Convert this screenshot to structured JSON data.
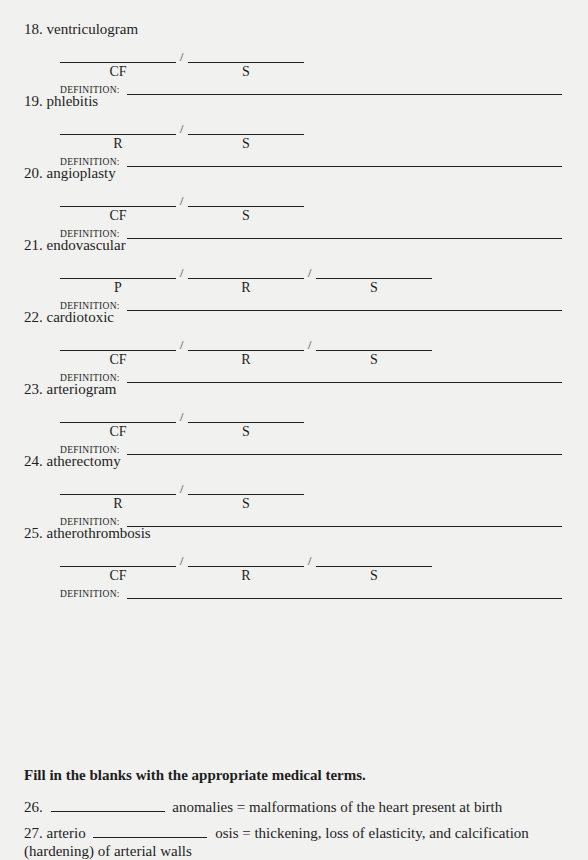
{
  "labels": {
    "definition": "DEFINITION:",
    "slash": "/"
  },
  "items": [
    {
      "number": "18.",
      "term": "ventriculogram",
      "parts": [
        "CF",
        "S"
      ]
    },
    {
      "number": "19.",
      "term": "phlebitis",
      "parts": [
        "R",
        "S"
      ]
    },
    {
      "number": "20.",
      "term": "angioplasty",
      "parts": [
        "CF",
        "S"
      ]
    },
    {
      "number": "21.",
      "term": "endovascular",
      "parts": [
        "P",
        "R",
        "S"
      ]
    },
    {
      "number": "22.",
      "term": "cardiotoxic",
      "parts": [
        "CF",
        "R",
        "S"
      ]
    },
    {
      "number": "23.",
      "term": "arteriogram",
      "parts": [
        "CF",
        "S"
      ]
    },
    {
      "number": "24.",
      "term": "atherectomy",
      "parts": [
        "R",
        "S"
      ]
    },
    {
      "number": "25.",
      "term": "atherothrombosis",
      "parts": [
        "CF",
        "R",
        "S"
      ]
    }
  ],
  "instructions": "Fill in the blanks with the appropriate medical terms.",
  "fill_in": [
    {
      "number": "26.",
      "before": "",
      "after": "anomalies = malformations of the heart present at birth"
    },
    {
      "number": "27.",
      "before": "arterio",
      "after": "osis = thickening, loss of elasticity, and calcification (hardening) of arterial walls"
    }
  ]
}
